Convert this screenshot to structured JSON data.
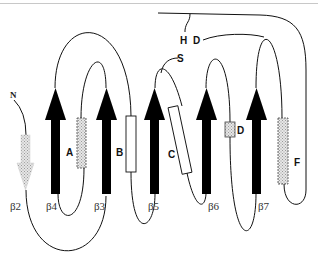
{
  "diagram": {
    "type": "protein-topology",
    "terminus_label": "N",
    "strands": [
      {
        "id": "b2",
        "label": "β2",
        "style": "shaded",
        "direction": "down"
      },
      {
        "id": "b4",
        "label": "β4",
        "style": "solid",
        "direction": "up"
      },
      {
        "id": "b3",
        "label": "β3",
        "style": "solid",
        "direction": "up"
      },
      {
        "id": "b5",
        "label": "β5",
        "style": "solid",
        "direction": "up"
      },
      {
        "id": "b6",
        "label": "β6",
        "style": "solid",
        "direction": "up"
      },
      {
        "id": "b7",
        "label": "β7",
        "style": "solid",
        "direction": "up"
      }
    ],
    "helices": [
      {
        "id": "A",
        "label": "A",
        "style": "dotted-shaded"
      },
      {
        "id": "B",
        "label": "B",
        "style": "open"
      },
      {
        "id": "C",
        "label": "C",
        "style": "open"
      },
      {
        "id": "D",
        "label": "D",
        "style": "dotted-shaded"
      },
      {
        "id": "F",
        "label": "F",
        "style": "dotted-shaded"
      }
    ],
    "annotations": [
      {
        "id": "S",
        "label": "S"
      },
      {
        "id": "H",
        "label": "H"
      },
      {
        "id": "D2",
        "label": "D"
      }
    ],
    "colors": {
      "strand_fill": "#000000",
      "shaded_fill": "#d9d9d9",
      "open_fill": "#ffffff",
      "line": "#111111"
    }
  }
}
